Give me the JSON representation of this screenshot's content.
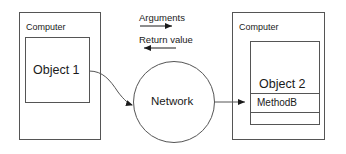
{
  "diagram": {
    "stroke_color": "#555555",
    "text_color": "#1a1a1a",
    "background": "#ffffff",
    "left_computer": {
      "label": "Computer",
      "object": {
        "label": "Object 1"
      }
    },
    "right_computer": {
      "label": "Computer",
      "object": {
        "label": "Object 2",
        "method": "MethodB",
        "empty_row": ""
      }
    },
    "network": {
      "label": "Network"
    },
    "flows": {
      "arguments_label": "Arguments",
      "arguments_direction": "right",
      "return_label": "Return value",
      "return_direction": "left"
    }
  }
}
